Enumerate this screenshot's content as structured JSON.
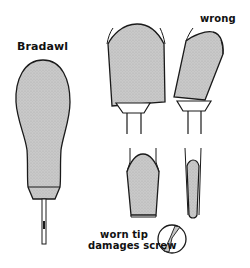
{
  "labels": {
    "bradawl": "Bradawl",
    "wrong": "wrong",
    "worn_tip_line1": "worn tip",
    "worn_tip_line2": "damages screw"
  },
  "colors": {
    "fill": "#c8c8c8",
    "stroke": "#1a1a1a",
    "background": "#ffffff"
  },
  "figures": [
    {
      "name": "bradawl",
      "description": "Bradawl tool with bulb-shaped stippled handle and thin steel blade"
    },
    {
      "name": "correct-screwdriver-fit",
      "description": "Screwdriver tip fitting squarely in screw slot"
    },
    {
      "name": "wrong-screwdriver-fit",
      "description": "Screwdriver tip tilted in screw slot"
    },
    {
      "name": "tip-front-view",
      "description": "Correctly ground screwdriver tip, front view"
    },
    {
      "name": "tip-side-view",
      "description": "Correctly ground screwdriver tip, side view"
    },
    {
      "name": "worn-tip-screw-head",
      "description": "Screw head with damaged slot from worn tip"
    }
  ]
}
